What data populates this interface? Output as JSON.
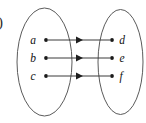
{
  "figure": {
    "tag": ")",
    "background_color": "#ffffff",
    "outline_color": "#5b5b5b",
    "arrow_color": "#3a3a3a",
    "dot_color": "#1a1a1a",
    "label_color": "#121212",
    "width": 146,
    "height": 123
  },
  "domain_set": {
    "name": "domain-ellipse",
    "cx": 44.5,
    "cy": 62,
    "rx": 27.5,
    "ry": 54,
    "elements": [
      {
        "label": "a",
        "dot_x": 46,
        "dot_y": 40,
        "label_x": 33,
        "label_y": 44
      },
      {
        "label": "b",
        "dot_x": 46,
        "dot_y": 58,
        "label_x": 33,
        "label_y": 62
      },
      {
        "label": "c",
        "dot_x": 46,
        "dot_y": 76,
        "label_x": 33,
        "label_y": 80
      }
    ]
  },
  "codomain_set": {
    "name": "codomain-ellipse",
    "cx": 120.5,
    "cy": 62,
    "rx": 22.5,
    "ry": 52.5,
    "elements": [
      {
        "label": "d",
        "dot_x": 112,
        "dot_y": 40,
        "label_x": 119,
        "label_y": 44
      },
      {
        "label": "e",
        "dot_x": 112,
        "dot_y": 58,
        "label_x": 119,
        "label_y": 62
      },
      {
        "label": "f",
        "dot_x": 112,
        "dot_y": 76,
        "label_x": 119,
        "label_y": 80
      }
    ]
  },
  "mappings": [
    {
      "from": "a",
      "to": "d",
      "x1": 48,
      "x2": 110,
      "y": 40,
      "head_x": 82
    },
    {
      "from": "b",
      "to": "e",
      "x1": 48,
      "x2": 110,
      "y": 58,
      "head_x": 82
    },
    {
      "from": "c",
      "to": "f",
      "x1": 48,
      "x2": 110,
      "y": 76,
      "head_x": 82
    }
  ]
}
